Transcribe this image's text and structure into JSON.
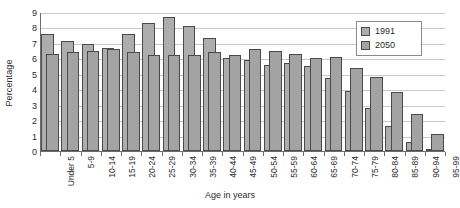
{
  "chart_data": {
    "type": "bar",
    "title": "",
    "xlabel": "Age in years",
    "ylabel": "Percentage",
    "ylim": [
      0,
      9
    ],
    "ytick_labels": [
      "0",
      "1",
      "2",
      "3",
      "4",
      "5",
      "6",
      "7",
      "8",
      "9"
    ],
    "grid": true,
    "legend_position": "top-right",
    "bar_style": "overlapping",
    "categories": [
      "Under 5",
      "5-9",
      "10-14",
      "15-19",
      "20-24",
      "25-29",
      "30-34",
      "35-39",
      "40-44",
      "45-49",
      "50-54",
      "55-59",
      "60-64",
      "65-69",
      "70-74",
      "75-79",
      "80-84",
      "85-89",
      "90-94",
      "95-99"
    ],
    "series": [
      {
        "name": "1991",
        "color": "#adadad",
        "values": [
          7.6,
          7.1,
          6.9,
          6.7,
          7.6,
          8.3,
          8.7,
          8.1,
          7.3,
          6.0,
          5.9,
          5.6,
          5.7,
          5.5,
          4.7,
          3.9,
          2.8,
          1.6,
          0.6,
          0.1
        ]
      },
      {
        "name": "2050",
        "color": "#a3a3a3",
        "values": [
          6.3,
          6.4,
          6.5,
          6.6,
          6.4,
          6.2,
          6.2,
          6.2,
          6.4,
          6.2,
          6.6,
          6.5,
          6.3,
          6.0,
          6.1,
          5.4,
          4.8,
          3.8,
          2.4,
          1.1
        ]
      }
    ]
  },
  "legend": {
    "items": [
      {
        "label": "1991"
      },
      {
        "label": "2050"
      }
    ]
  }
}
